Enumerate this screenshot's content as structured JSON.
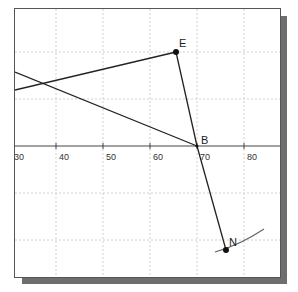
{
  "diagram": {
    "type": "geometry-plot",
    "axis": {
      "tick_labels": [
        "30",
        "40",
        "50",
        "60",
        "70",
        "80"
      ]
    },
    "points": [
      {
        "label": "E"
      },
      {
        "label": "B"
      },
      {
        "label": "N"
      }
    ],
    "colors": {
      "line": "#222222",
      "grid": "#cccccc",
      "shadow": "#6e6e6e",
      "border": "#555555",
      "arc": "#666666"
    }
  }
}
